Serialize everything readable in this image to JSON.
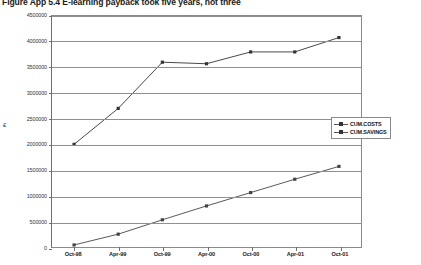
{
  "title": "Figure App 5.4  E-learning payback took five years, not three",
  "legend": {
    "position": "right-middle",
    "entries": [
      {
        "label": "CUM.COSTS",
        "color": "#444444",
        "marker": "diamond"
      },
      {
        "label": "CUM.SAVINGS",
        "color": "#333333",
        "marker": "square"
      }
    ]
  },
  "chart_data": {
    "type": "line",
    "title": "Figure App 5.4  E-learning payback took five years, not three",
    "xlabel": "",
    "ylabel": "£",
    "categories": [
      "Oct-98",
      "Apr-99",
      "Oct-99",
      "Apr-00",
      "Oct-00",
      "Apr-01",
      "Oct-01"
    ],
    "ylim": [
      0,
      4500000
    ],
    "ytick_labels": [
      "0",
      "500000",
      "1000000",
      "1500000",
      "2000000",
      "2500000",
      "3000000",
      "3500000",
      "4000000",
      "4500000"
    ],
    "ytick_values": [
      0,
      500000,
      1000000,
      1500000,
      2000000,
      2500000,
      3000000,
      3500000,
      4000000,
      4500000
    ],
    "grid": true,
    "legend_position": "right",
    "series": [
      {
        "name": "CUM.COSTS",
        "color": "#444444",
        "values": [
          40000,
          250000,
          530000,
          800000,
          1060000,
          1320000,
          1570000
        ]
      },
      {
        "name": "CUM.SAVINGS",
        "color": "#333333",
        "values": [
          2000000,
          2700000,
          3600000,
          3570000,
          3800000,
          3800000,
          4080000
        ]
      }
    ]
  }
}
